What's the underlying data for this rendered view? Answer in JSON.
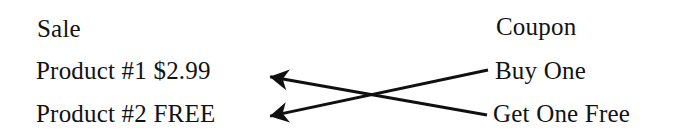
{
  "diagram": {
    "title_not_shown": "",
    "background_color": "#ffffff",
    "ink_color": "#121212",
    "left_column": {
      "heading": "Sale",
      "rows": [
        {
          "label": "Product #1 $2.99"
        },
        {
          "label": "Product #2 FREE"
        }
      ]
    },
    "right_column": {
      "heading": "Coupon",
      "rows": [
        {
          "label": "Buy One"
        },
        {
          "label": "Get One Free"
        }
      ]
    },
    "connectors": [
      {
        "name": "buy-one-to-product-2",
        "from": "Buy One",
        "to": "Product #2 FREE",
        "direction": "right-to-left",
        "arrowhead_at": "left",
        "start_x": 488,
        "start_y": 70,
        "end_x": 266,
        "end_y": 117,
        "color": "#101010",
        "width": 3
      },
      {
        "name": "get-one-free-to-product-1",
        "from": "Get One Free",
        "to": "Product #1 $2.99",
        "direction": "right-to-left",
        "arrowhead_at": "left",
        "start_x": 487,
        "start_y": 115,
        "end_x": 266,
        "end_y": 76,
        "color": "#101010",
        "width": 3
      }
    ],
    "crossing_point": {
      "x": 378,
      "y": 95
    }
  }
}
